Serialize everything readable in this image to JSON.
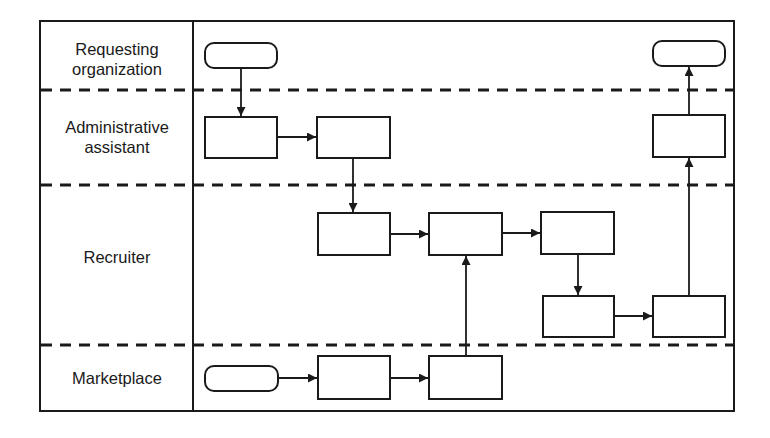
{
  "diagram": {
    "type": "swimlane-flowchart",
    "colors": {
      "stroke": "#1a1a1a",
      "background": "#ffffff"
    },
    "lanes": [
      {
        "id": "requesting",
        "label_line1": "Requesting",
        "label_line2": "organization"
      },
      {
        "id": "admin",
        "label_line1": "Administrative",
        "label_line2": "assistant"
      },
      {
        "id": "recruiter",
        "label_line1": "Recruiter",
        "label_line2": ""
      },
      {
        "id": "marketplace",
        "label_line1": "Marketplace",
        "label_line2": ""
      }
    ],
    "nodes": [
      {
        "id": "start-requesting",
        "shape": "terminator",
        "lane": "requesting",
        "label": ""
      },
      {
        "id": "admin-step-1",
        "shape": "process",
        "lane": "admin",
        "label": ""
      },
      {
        "id": "admin-step-2",
        "shape": "process",
        "lane": "admin",
        "label": ""
      },
      {
        "id": "recruiter-step-1",
        "shape": "process",
        "lane": "recruiter",
        "label": ""
      },
      {
        "id": "recruiter-step-2",
        "shape": "process",
        "lane": "recruiter",
        "label": ""
      },
      {
        "id": "recruiter-step-3",
        "shape": "process",
        "lane": "recruiter",
        "label": ""
      },
      {
        "id": "recruiter-step-4",
        "shape": "process",
        "lane": "recruiter",
        "label": ""
      },
      {
        "id": "recruiter-step-5",
        "shape": "process",
        "lane": "recruiter",
        "label": ""
      },
      {
        "id": "admin-step-3",
        "shape": "process",
        "lane": "admin",
        "label": ""
      },
      {
        "id": "end-requesting",
        "shape": "terminator",
        "lane": "requesting",
        "label": ""
      },
      {
        "id": "start-marketplace",
        "shape": "terminator",
        "lane": "marketplace",
        "label": ""
      },
      {
        "id": "marketplace-step-1",
        "shape": "process",
        "lane": "marketplace",
        "label": ""
      },
      {
        "id": "marketplace-step-2",
        "shape": "process",
        "lane": "marketplace",
        "label": ""
      }
    ],
    "edges": [
      [
        "start-requesting",
        "admin-step-1"
      ],
      [
        "admin-step-1",
        "admin-step-2"
      ],
      [
        "admin-step-2",
        "recruiter-step-1"
      ],
      [
        "recruiter-step-1",
        "recruiter-step-2"
      ],
      [
        "recruiter-step-2",
        "recruiter-step-3"
      ],
      [
        "recruiter-step-3",
        "recruiter-step-4"
      ],
      [
        "recruiter-step-4",
        "recruiter-step-5"
      ],
      [
        "recruiter-step-5",
        "admin-step-3"
      ],
      [
        "admin-step-3",
        "end-requesting"
      ],
      [
        "start-marketplace",
        "marketplace-step-1"
      ],
      [
        "marketplace-step-1",
        "marketplace-step-2"
      ],
      [
        "marketplace-step-2",
        "recruiter-step-2"
      ]
    ]
  }
}
